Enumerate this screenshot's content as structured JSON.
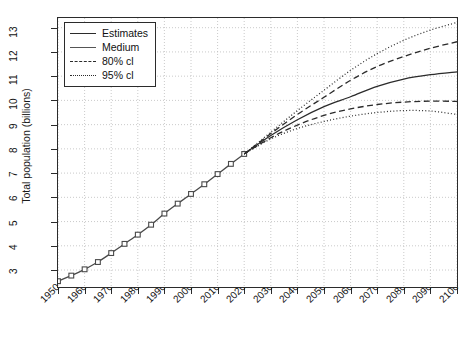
{
  "chart_data": {
    "type": "line",
    "title": "",
    "xlabel": "",
    "ylabel": "Total population (billions)",
    "xlim": [
      1950,
      2100
    ],
    "ylim": [
      2.3,
      13.4
    ],
    "yticks": [
      3,
      4,
      5,
      6,
      7,
      8,
      9,
      10,
      11,
      12,
      13
    ],
    "xticks": [
      1950,
      1960,
      1970,
      1980,
      1990,
      2000,
      2010,
      2020,
      2030,
      2040,
      2050,
      2060,
      2070,
      2080,
      2090,
      2100
    ],
    "grid": true,
    "legend_position": "top-left",
    "legend": [
      "Estimates",
      "Medium",
      "80% cl",
      "95% cl"
    ],
    "series": [
      {
        "name": "Estimates",
        "style": "solid-with-square-markers",
        "color": "#4a4a4a",
        "x": [
          1950,
          1955,
          1960,
          1965,
          1970,
          1975,
          1980,
          1985,
          1990,
          1995,
          2000,
          2005,
          2010,
          2015,
          2020
        ],
        "values": [
          2.54,
          2.77,
          3.03,
          3.33,
          3.7,
          4.08,
          4.46,
          4.87,
          5.33,
          5.74,
          6.14,
          6.54,
          6.96,
          7.38,
          7.79
        ]
      },
      {
        "name": "Medium",
        "style": "solid",
        "color": "#2b2b2b",
        "x": [
          2020,
          2030,
          2040,
          2050,
          2060,
          2070,
          2080,
          2090,
          2100
        ],
        "values": [
          7.79,
          8.55,
          9.2,
          9.74,
          10.15,
          10.58,
          10.88,
          11.06,
          11.18
        ]
      },
      {
        "name": "80% cl upper",
        "style": "dashed",
        "color": "#2b2b2b",
        "x": [
          2020,
          2030,
          2040,
          2050,
          2060,
          2070,
          2080,
          2090,
          2100
        ],
        "values": [
          7.79,
          8.63,
          9.42,
          10.13,
          10.83,
          11.4,
          11.81,
          12.15,
          12.42
        ]
      },
      {
        "name": "80% cl lower",
        "style": "dashed",
        "color": "#2b2b2b",
        "x": [
          2020,
          2030,
          2040,
          2050,
          2060,
          2070,
          2080,
          2090,
          2100
        ],
        "values": [
          7.79,
          8.46,
          8.98,
          9.38,
          9.65,
          9.83,
          9.93,
          9.97,
          9.96
        ]
      },
      {
        "name": "95% cl upper",
        "style": "dotted",
        "color": "#2b2b2b",
        "x": [
          2020,
          2030,
          2040,
          2050,
          2060,
          2070,
          2080,
          2090,
          2100
        ],
        "values": [
          7.79,
          8.69,
          9.58,
          10.42,
          11.24,
          11.93,
          12.48,
          12.9,
          13.22
        ]
      },
      {
        "name": "95% cl lower",
        "style": "dotted",
        "color": "#2b2b2b",
        "x": [
          2020,
          2030,
          2040,
          2050,
          2060,
          2070,
          2080,
          2090,
          2100
        ],
        "values": [
          7.79,
          8.41,
          8.84,
          9.13,
          9.35,
          9.5,
          9.58,
          9.56,
          9.42
        ]
      }
    ]
  },
  "legend": {
    "items": [
      {
        "label": "Estimates",
        "key": "solid"
      },
      {
        "label": "Medium",
        "key": "solid"
      },
      {
        "label": "80% cl",
        "key": "dashed"
      },
      {
        "label": "95% cl",
        "key": "dotted"
      }
    ]
  },
  "axes": {
    "y_title": "Total population (billions)"
  }
}
